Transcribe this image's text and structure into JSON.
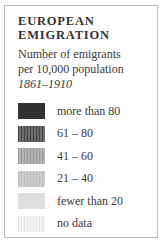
{
  "legend": {
    "title_line1": "EUROPEAN",
    "title_line2": "EMIGRATION",
    "subtitle_line1": "Number of emigrants",
    "subtitle_line2": "per 10,000 population",
    "date_range": "1861–1910",
    "items": [
      {
        "label": "more than 80",
        "pattern": "solid",
        "base_color": "#313131",
        "stripe_color": "#313131"
      },
      {
        "label": "61 – 80",
        "pattern": "vertical-stripes",
        "base_color": "#6e6e6e",
        "stripe_color": "#424242"
      },
      {
        "label": "41 – 60",
        "pattern": "vertical-stripes",
        "base_color": "#b2b2b2",
        "stripe_color": "#9a9a9a"
      },
      {
        "label": "21 – 40",
        "pattern": "vertical-stripes",
        "base_color": "#cdcdcd",
        "stripe_color": "#bbbbbb"
      },
      {
        "label": "fewer than 20",
        "pattern": "solid",
        "base_color": "#dedede",
        "stripe_color": "#dedede"
      },
      {
        "label": "no data",
        "pattern": "vertical-stripes",
        "base_color": "#f3f3f3",
        "stripe_color": "#e3e3e3"
      }
    ]
  }
}
